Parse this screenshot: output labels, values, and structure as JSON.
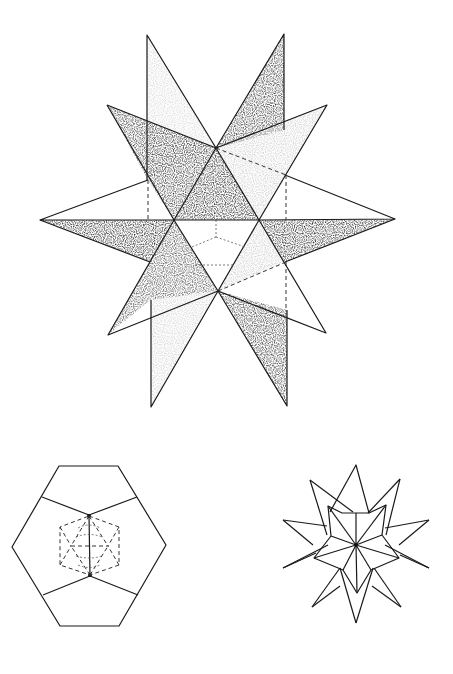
{
  "figure": {
    "main_view": {
      "description": "stippled shaded star polyhedron, front view",
      "shading": {
        "dark": "#2a2a2a",
        "medium": "#6e6e6e",
        "light": "#d6d6d6",
        "white": "#ffffff"
      },
      "vertices": {
        "top_left_spike": [
          147,
          35
        ],
        "top_right_spike": [
          284,
          34
        ],
        "upper_left_spike": [
          107,
          105
        ],
        "upper_right_spike": [
          327,
          105
        ],
        "left_point": [
          40,
          220
        ],
        "right_point": [
          395,
          219
        ],
        "lower_left_spike": [
          108,
          335
        ],
        "lower_right_spike": [
          326,
          333
        ],
        "bottom_left_spike": [
          151,
          407
        ],
        "bottom_right_spike": [
          287,
          406
        ],
        "center_top": [
          216,
          148
        ],
        "center_bottom": [
          218,
          291
        ],
        "mid_left": [
          174,
          220
        ],
        "mid_right": [
          259,
          220
        ]
      }
    },
    "top_view": {
      "description": "dodecahedron outline with inner dashed icosahedron",
      "center": [
        89,
        545
      ]
    },
    "side_view": {
      "description": "line-drawing star projection",
      "center": [
        356,
        545
      ]
    }
  }
}
